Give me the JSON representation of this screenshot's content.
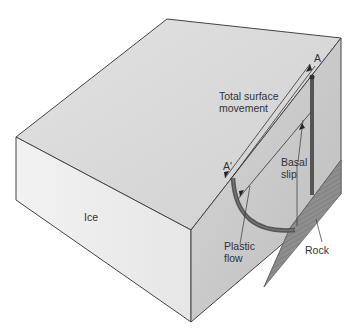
{
  "diagram": {
    "type": "glacier-flow-block",
    "labels": {
      "ice": "Ice",
      "point_a": "A",
      "point_a_prime": "A'",
      "total_surface_movement_1": "Total surface",
      "total_surface_movement_2": "movement",
      "basal_slip_1": "Basal",
      "basal_slip_2": "slip",
      "plastic_flow_1": "Plastic",
      "plastic_flow_2": "flow",
      "rock": "Rock"
    },
    "colors": {
      "ice_top": "#dcdcdc",
      "ice_front": "#eeeeee",
      "ice_cut": "#c9c9c9",
      "rock": "#8a8a8a",
      "rod": "#5a5a5a",
      "outline": "#444444"
    }
  }
}
